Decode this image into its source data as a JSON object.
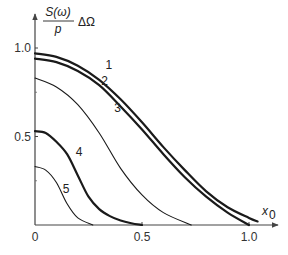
{
  "chart_data": {
    "type": "line",
    "title": "",
    "xlabel": "x0",
    "ylabel": "S(ω)/p ΔΩ",
    "ylabel_parts": {
      "numerator": "S(ω)",
      "denominator": "p",
      "suffix": "ΔΩ"
    },
    "xlabel_parts": {
      "base": "x",
      "sub": "0"
    },
    "xlim": [
      0,
      1.1
    ],
    "ylim": [
      0,
      1.05
    ],
    "grid": false,
    "legend": "inline curve numbers",
    "x_ticks": [
      {
        "value": 0,
        "label": "0"
      },
      {
        "value": 0.5,
        "label": "0.5"
      },
      {
        "value": 1.0,
        "label": "1.0"
      }
    ],
    "y_ticks": [
      {
        "value": 0.5,
        "label": "0.5"
      },
      {
        "value": 1.0,
        "label": "1.0"
      }
    ],
    "series": [
      {
        "name": "1",
        "stroke_width": 2.2,
        "x": [
          0,
          0.1,
          0.2,
          0.3,
          0.4,
          0.5,
          0.6,
          0.7,
          0.8,
          0.9,
          1.0,
          1.04
        ],
        "y": [
          0.97,
          0.95,
          0.9,
          0.82,
          0.71,
          0.58,
          0.44,
          0.31,
          0.19,
          0.1,
          0.04,
          0.02
        ],
        "label_pos": {
          "x": 0.33,
          "y": 0.88
        }
      },
      {
        "name": "2",
        "stroke_width": 2.2,
        "x": [
          0,
          0.1,
          0.2,
          0.3,
          0.4,
          0.5,
          0.6,
          0.7,
          0.8,
          0.9,
          1.0
        ],
        "y": [
          0.94,
          0.92,
          0.87,
          0.79,
          0.67,
          0.54,
          0.4,
          0.27,
          0.16,
          0.07,
          0.0
        ],
        "label_pos": {
          "x": 0.31,
          "y": 0.79
        }
      },
      {
        "name": "3",
        "stroke_width": 1.1,
        "x": [
          0,
          0.1,
          0.2,
          0.3,
          0.4,
          0.5,
          0.6,
          0.73
        ],
        "y": [
          0.83,
          0.78,
          0.68,
          0.52,
          0.32,
          0.17,
          0.07,
          0.0
        ],
        "label_pos": {
          "x": 0.37,
          "y": 0.64
        }
      },
      {
        "name": "4",
        "stroke_width": 2.2,
        "x": [
          0,
          0.05,
          0.1,
          0.15,
          0.2,
          0.25,
          0.3,
          0.35,
          0.4,
          0.45,
          0.5
        ],
        "y": [
          0.53,
          0.52,
          0.47,
          0.4,
          0.28,
          0.16,
          0.09,
          0.05,
          0.025,
          0.01,
          0.0
        ],
        "label_pos": {
          "x": 0.19,
          "y": 0.39
        }
      },
      {
        "name": "5",
        "stroke_width": 1.1,
        "x": [
          0,
          0.05,
          0.1,
          0.15,
          0.2,
          0.27
        ],
        "y": [
          0.33,
          0.31,
          0.24,
          0.12,
          0.04,
          0.0
        ],
        "label_pos": {
          "x": 0.13,
          "y": 0.18
        }
      }
    ]
  }
}
